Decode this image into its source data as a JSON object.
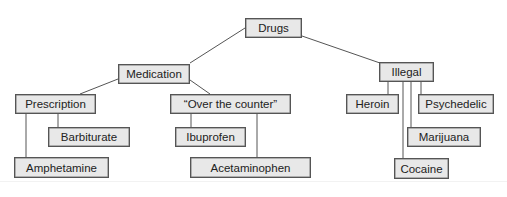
{
  "diagram": {
    "type": "tree",
    "title": "",
    "style": {
      "node_fill": "#e8e8e8",
      "node_border": "#555555",
      "edge_color": "#555555",
      "text_color": "#222222"
    },
    "nodes": {
      "drugs": {
        "label": "Drugs",
        "x": 245,
        "y": 18,
        "w": 57,
        "h": 20
      },
      "medication": {
        "label": "Medication",
        "x": 118,
        "y": 64,
        "w": 72,
        "h": 20
      },
      "illegal": {
        "label": "Illegal",
        "x": 379,
        "y": 62,
        "w": 55,
        "h": 20
      },
      "prescription": {
        "label": "Prescription",
        "x": 15,
        "y": 94,
        "w": 81,
        "h": 20
      },
      "otc": {
        "label": "“Over the counter”",
        "x": 170,
        "y": 94,
        "w": 121,
        "h": 20
      },
      "heroin": {
        "label": "Heroin",
        "x": 346,
        "y": 94,
        "w": 53,
        "h": 20
      },
      "psychedelic": {
        "label": "Psychedelic",
        "x": 418,
        "y": 94,
        "w": 76,
        "h": 20
      },
      "barbiturate": {
        "label": "Barbiturate",
        "x": 48,
        "y": 127,
        "w": 82,
        "h": 20
      },
      "ibuprofen": {
        "label": "Ibuprofen",
        "x": 175,
        "y": 127,
        "w": 71,
        "h": 20
      },
      "marijuana": {
        "label": "Marijuana",
        "x": 407,
        "y": 127,
        "w": 74,
        "h": 20
      },
      "amphetamine": {
        "label": "Amphetamine",
        "x": 14,
        "y": 157,
        "w": 95,
        "h": 21
      },
      "acetaminophen": {
        "label": "Acetaminophen",
        "x": 190,
        "y": 157,
        "w": 121,
        "h": 21
      },
      "cocaine": {
        "label": "Cocaine",
        "x": 394,
        "y": 158,
        "w": 55,
        "h": 21
      }
    },
    "edges": [
      {
        "from": "drugs",
        "to": "medication"
      },
      {
        "from": "drugs",
        "to": "illegal"
      },
      {
        "from": "medication",
        "to": "prescription"
      },
      {
        "from": "medication",
        "to": "otc"
      },
      {
        "from": "prescription",
        "to": "barbiturate"
      },
      {
        "from": "prescription",
        "to": "amphetamine"
      },
      {
        "from": "otc",
        "to": "ibuprofen"
      },
      {
        "from": "otc",
        "to": "acetaminophen"
      },
      {
        "from": "illegal",
        "to": "heroin"
      },
      {
        "from": "illegal",
        "to": "psychedelic"
      },
      {
        "from": "illegal",
        "to": "marijuana"
      },
      {
        "from": "illegal",
        "to": "cocaine"
      }
    ]
  }
}
